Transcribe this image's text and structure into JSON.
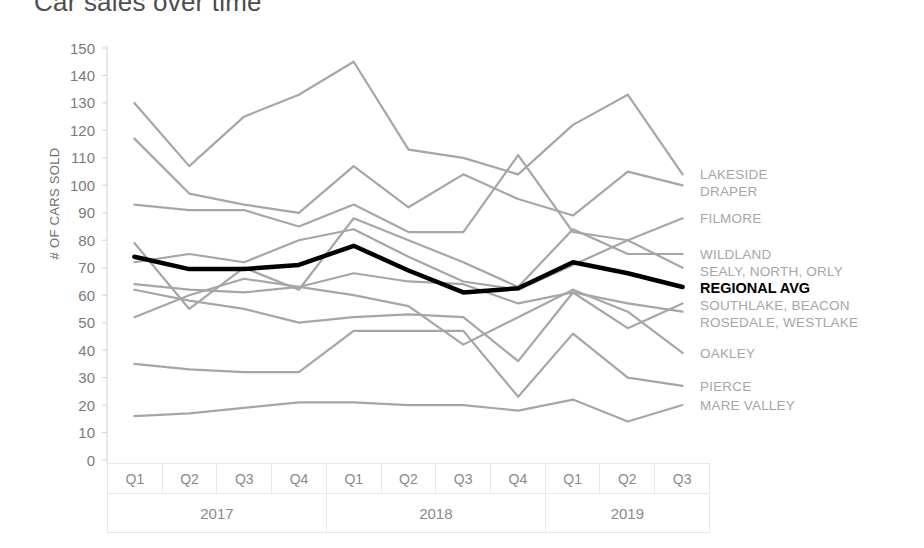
{
  "chart_data": {
    "type": "line",
    "title": "Car sales over time",
    "xlabel": "",
    "ylabel": "# OF CARS SOLD",
    "ylim": [
      0,
      150
    ],
    "ytick_step": 10,
    "yticks": [
      150,
      140,
      130,
      120,
      110,
      100,
      90,
      80,
      70,
      60,
      50,
      40,
      30,
      20,
      10,
      0
    ],
    "grid": false,
    "legend_position": "right-inline-labels",
    "x": [
      "Q1 2017",
      "Q2 2017",
      "Q3 2017",
      "Q4 2017",
      "Q1 2018",
      "Q2 2018",
      "Q3 2018",
      "Q4 2018",
      "Q1 2019",
      "Q2 2019",
      "Q3 2019"
    ],
    "x_quarters": [
      "Q1",
      "Q2",
      "Q3",
      "Q4",
      "Q1",
      "Q2",
      "Q3",
      "Q4",
      "Q1",
      "Q2",
      "Q3"
    ],
    "x_years": [
      {
        "label": "2017",
        "span": 4
      },
      {
        "label": "2018",
        "span": 4
      },
      {
        "label": "2019",
        "span": 3
      }
    ],
    "series": [
      {
        "name": "LAKESIDE",
        "label": "LAKESIDE",
        "color": "#a6a6a6",
        "emphasis": false,
        "label_row": 0,
        "values": [
          130,
          107,
          125,
          133,
          145,
          113,
          110,
          104,
          122,
          133,
          104
        ]
      },
      {
        "name": "DRAPER",
        "label": "DRAPER",
        "color": "#a6a6a6",
        "emphasis": false,
        "label_row": 1,
        "values": [
          117,
          97,
          93,
          90,
          107,
          92,
          104,
          95,
          89,
          105,
          100
        ]
      },
      {
        "name": "FILMORE",
        "label": "FILMORE",
        "color": "#a6a6a6",
        "emphasis": false,
        "label_row": 2,
        "values": [
          93,
          91,
          91,
          85,
          93,
          83,
          83,
          111,
          83,
          80,
          88
        ]
      },
      {
        "name": "WILDLAND",
        "label": "WILDLAND",
        "color": "#a6a6a6",
        "emphasis": false,
        "label_row": 3,
        "values": [
          79,
          55,
          70,
          62,
          88,
          80,
          72,
          63,
          84,
          75,
          75
        ]
      },
      {
        "name": "SEALY, NORTH, ORLY",
        "label": "SEALY, NORTH, ORLY",
        "color": "#a6a6a6",
        "emphasis": false,
        "label_row": 4,
        "values": [
          72,
          75,
          72,
          80,
          84,
          74,
          65,
          62,
          71,
          80,
          70
        ]
      },
      {
        "name": "REGIONAL AVG",
        "label": "REGIONAL AVG",
        "color": "#000000",
        "emphasis": true,
        "label_row": 5,
        "values": [
          74,
          69.5,
          69.5,
          71,
          78,
          69,
          61,
          62.5,
          72,
          68,
          63
        ]
      },
      {
        "name": "SOUTHLAKE, BEACON",
        "label": "SOUTHLAKE, BEACON",
        "color": "#a6a6a6",
        "emphasis": false,
        "label_row": 6,
        "values": [
          64,
          62,
          61,
          63,
          68,
          65,
          64,
          57,
          61,
          48,
          57
        ]
      },
      {
        "name": "ROSEDALE, WESTLAKE",
        "label": "ROSEDALE, WESTLAKE",
        "color": "#a6a6a6",
        "emphasis": false,
        "label_row": 7,
        "values": [
          62,
          58,
          55,
          50,
          52,
          53,
          52,
          36,
          61,
          57,
          54
        ]
      },
      {
        "name": "OAKLEY",
        "label": "OAKLEY",
        "color": "#a6a6a6",
        "emphasis": false,
        "label_row": 8,
        "values": [
          52,
          60,
          66,
          63,
          60,
          56,
          42,
          52,
          62,
          54,
          39
        ]
      },
      {
        "name": "PIERCE",
        "label": "PIERCE",
        "color": "#a6a6a6",
        "emphasis": false,
        "label_row": 9,
        "values": [
          35,
          33,
          32,
          32,
          47,
          47,
          47,
          23,
          46,
          30,
          27
        ]
      },
      {
        "name": "MARE VALLEY",
        "label": "MARE VALLEY",
        "color": "#a6a6a6",
        "emphasis": false,
        "label_row": 10,
        "values": [
          16,
          17,
          19,
          21,
          21,
          20,
          20,
          18,
          22,
          14,
          20
        ]
      }
    ]
  },
  "colors": {
    "series_gray": "#a6a6a6",
    "emphasis_black": "#000000",
    "axis_gray": "#d9d9d9",
    "tick_text": "#7a7a7a",
    "title_text": "#4d4d4d"
  }
}
